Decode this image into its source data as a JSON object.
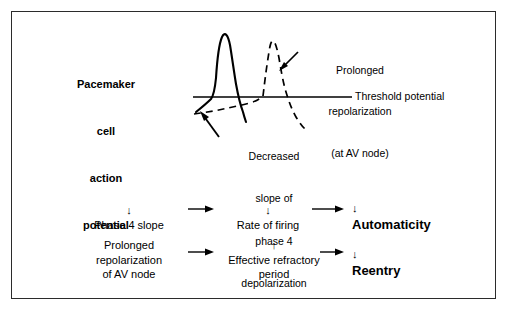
{
  "figure": {
    "kind": "medical-physiology-diagram",
    "frame_color": "#2b2b2b",
    "background_color": "#ffffff",
    "ink_color": "#000000"
  },
  "action_potential_panel": {
    "title_lines": [
      "Pacemaker",
      "cell",
      "action",
      "potential"
    ],
    "threshold_label": "Threshold potential",
    "prolonged_note_lines": [
      "Prolonged",
      "repolarization",
      "(at AV node)"
    ],
    "decreased_note_lines": [
      "Decreased",
      "slope of",
      "phase 4",
      "depolarization"
    ],
    "curves": [
      {
        "name": "normal-action-potential",
        "style": "solid",
        "stroke": "#000000"
      },
      {
        "name": "prolonged-repolarization-action-potential",
        "style": "dashed",
        "stroke": "#000000"
      },
      {
        "name": "decreased-phase-4-slope",
        "style": "dashed",
        "stroke": "#000000"
      }
    ]
  },
  "flow": {
    "rows": [
      {
        "name": "automaticity-pathway",
        "cells": [
          {
            "arrow_prefix": "↓",
            "lines": [
              "Phase 4 slope"
            ],
            "emphasis": "normal"
          },
          {
            "arrow_prefix": "↓",
            "lines": [
              "Rate of firing"
            ],
            "emphasis": "normal"
          },
          {
            "arrow_prefix": "↓",
            "lines": [
              "Automaticity"
            ],
            "emphasis": "bold"
          }
        ]
      },
      {
        "name": "reentry-pathway",
        "cells": [
          {
            "arrow_prefix": "",
            "lines": [
              "Prolonged",
              "repolarization",
              "of AV node"
            ],
            "emphasis": "normal"
          },
          {
            "arrow_prefix": "↑",
            "lines": [
              "Effective refractory",
              "period"
            ],
            "emphasis": "normal"
          },
          {
            "arrow_prefix": "↓",
            "lines": [
              "Reentry"
            ],
            "emphasis": "bold"
          }
        ]
      }
    ]
  },
  "glyphs": {
    "down_arrow": "↓",
    "up_arrow": "↑"
  }
}
